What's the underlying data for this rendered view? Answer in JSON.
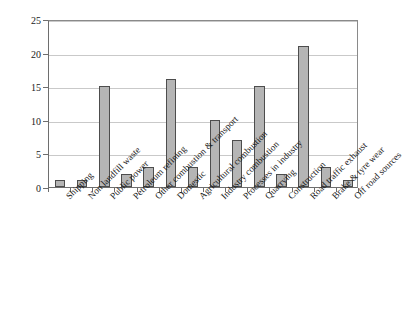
{
  "chart_data": {
    "type": "bar",
    "title": "",
    "subtitle": "",
    "xlabel": "",
    "ylabel": "% of UK PM10 emissions",
    "ylabel_prefix": "% of UK PM",
    "ylabel_sub": "10",
    "ylabel_suffix": " emissions",
    "ylim": [
      0,
      25
    ],
    "yticks": [
      0,
      5,
      10,
      15,
      20,
      25
    ],
    "ytick_labels": [
      "0",
      "5",
      "10",
      "15",
      "20",
      "25"
    ],
    "grid": true,
    "grid_axis": "y",
    "legend": false,
    "legend_position": "none",
    "bar_color": "#b5b5b5",
    "bar_edge_color": "#4d4d4d",
    "grid_color": "#c9c9c9",
    "axis_color": "#6e6e6e",
    "label_rotation": -45,
    "categories": [
      "Shipping",
      "Non landfill waste",
      "Public power",
      "Petroleum refining",
      "Other combustion & transport",
      "Domestic",
      "Agricultural combustion",
      "Industry combustion",
      "Processes in industry",
      "Quarrying",
      "Construction",
      "Road traffic exhaust",
      "Brake & tyre wear",
      "Off road sources"
    ],
    "values": [
      1,
      1,
      15,
      2,
      3,
      16,
      3,
      10,
      7,
      15,
      2,
      21,
      3,
      1
    ]
  }
}
